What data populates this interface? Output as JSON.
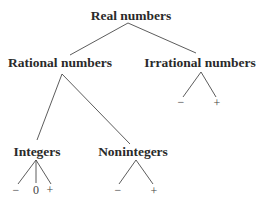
{
  "diagram": {
    "nodes": {
      "root": "Real numbers",
      "rational": "Rational numbers",
      "irrational": "Irrational numbers",
      "integers": "Integers",
      "nonintegers": "Nonintegers"
    },
    "leaves": {
      "irrational_neg": "−",
      "irrational_pos": "+",
      "integers_neg": "−",
      "integers_zero": "0",
      "integers_pos": "+",
      "nonintegers_neg": "−",
      "nonintegers_pos": "+"
    },
    "colors": {
      "text": "#2a2a2a",
      "line": "#4a4a4a",
      "background": "#ffffff"
    }
  }
}
